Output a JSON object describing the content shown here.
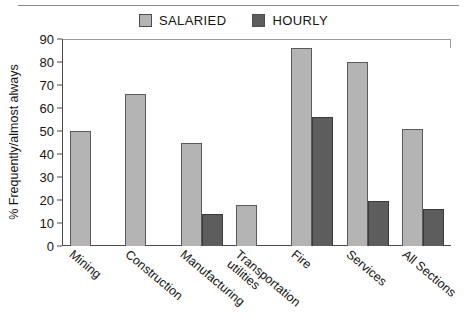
{
  "chart_data": {
    "type": "bar",
    "title": "",
    "xlabel": "",
    "ylabel": "% Frequently/almost always",
    "ylim": [
      0,
      90
    ],
    "yticks": [
      90,
      80,
      70,
      60,
      50,
      40,
      30,
      20,
      10,
      0
    ],
    "grid": false,
    "legend_position": "top-center",
    "categories": [
      "Mining",
      "Construction",
      "Manufacturing",
      "Transportation utilities",
      "Fire",
      "Services",
      "All Sections"
    ],
    "category_lines": [
      [
        "Mining"
      ],
      [
        "Construction"
      ],
      [
        "Manufacturing"
      ],
      [
        "Transportation",
        "utilities"
      ],
      [
        "Fire"
      ],
      [
        "Services"
      ],
      [
        "All Sections"
      ]
    ],
    "series": [
      {
        "name": "SALARIED",
        "color": "#b4b4b4",
        "values": [
          50,
          66,
          45,
          18,
          86,
          80,
          51
        ]
      },
      {
        "name": "HOURLY",
        "color": "#5d5d5d",
        "values": [
          null,
          null,
          14,
          null,
          56,
          19.5,
          16
        ]
      }
    ]
  },
  "legend": {
    "items": [
      {
        "label": "SALARIED",
        "color": "#b4b4b4"
      },
      {
        "label": "HOURLY",
        "color": "#5d5d5d"
      }
    ]
  },
  "axis": {
    "y_title": "% Frequently/almost always",
    "y_ticks": [
      "90",
      "80",
      "70",
      "60",
      "50",
      "40",
      "30",
      "20",
      "10",
      "0"
    ]
  }
}
